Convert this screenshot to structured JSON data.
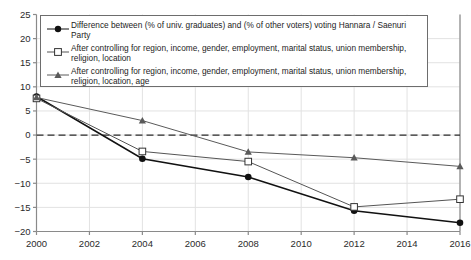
{
  "chart_data": {
    "type": "line",
    "title": "",
    "xlabel": "",
    "ylabel": "",
    "x": [
      2000,
      2004,
      2008,
      2012,
      2016
    ],
    "categories": [
      "2000",
      "2004",
      "2008",
      "2012",
      "2016"
    ],
    "xlim": [
      2000,
      2016
    ],
    "ylim": [
      -20,
      25
    ],
    "ytick_labels": [
      "25",
      "20",
      "15",
      "10",
      "5",
      "0",
      "−5",
      "−10",
      "−15",
      "−20"
    ],
    "ytick_values": [
      25,
      20,
      15,
      10,
      5,
      0,
      -5,
      -10,
      -15,
      -20
    ],
    "xtick_labels": [
      "2000",
      "2002",
      "2004",
      "2006",
      "2008",
      "2010",
      "2012",
      "2014",
      "2016"
    ],
    "xtick_values": [
      2000,
      2002,
      2004,
      2006,
      2008,
      2010,
      2012,
      2014,
      2016
    ],
    "grid": true,
    "zero_line": true,
    "legend_position": "upper-left-inside",
    "series": [
      {
        "name": "Difference between (% of univ. graduates) and (% of other voters) voting Hannara / Saenuri Party",
        "marker": "filled-circle",
        "color": "#111111",
        "values": [
          8.0,
          -4.9,
          -8.7,
          -15.7,
          -18.2
        ]
      },
      {
        "name": "After controlling for region, income, gender, employment, marital status, union membership, religion, location",
        "marker": "open-square",
        "color": "#555555",
        "values": [
          7.6,
          -3.4,
          -5.5,
          -14.9,
          -13.3
        ]
      },
      {
        "name": "After controlling for region, income, gender, employment, marital status, union membership, religion, location, age",
        "marker": "filled-triangle",
        "color": "#5a5a5a",
        "values": [
          7.8,
          3.0,
          -3.5,
          -4.7,
          -6.5
        ]
      }
    ]
  },
  "legend": {
    "items": [
      {
        "label": "Difference between (% of univ. graduates) and (% of other voters) voting Hannara / Saenuri Party",
        "marker": "filled-circle"
      },
      {
        "label": "After controlling for region, income, gender, employment, marital status, union membership,\nreligion, location",
        "marker": "open-square"
      },
      {
        "label": "After controlling for region, income, gender, employment, marital status, union membership,\nreligion, location, age",
        "marker": "filled-triangle"
      }
    ]
  },
  "colors": {
    "axis": "#8a8a8a",
    "grid": "#e2e2e2",
    "zero_line": "#2b2b2b",
    "series1": "#111111",
    "series2": "#555555",
    "series3": "#5a5a5a",
    "background": "#ffffff"
  }
}
